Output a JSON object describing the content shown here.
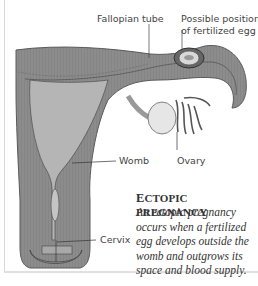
{
  "labels": {
    "fallopian_tube": "Fallopian tube",
    "possible_position_line1": "Possible position",
    "possible_position_line2": "of fertilized egg",
    "womb": "Womb",
    "ovary": "Ovary",
    "cervix": "Cervix"
  },
  "caption": {
    "title_first": "E",
    "title_rest": "CTOPIC PREGNANCY",
    "body": "An ectopic pregnancy occurs when a fertilized egg develops outside the womb and outgrows its space and blood supply."
  },
  "colors": {
    "tissue": "#8f8f8f",
    "tissue_dark": "#6e6e6e",
    "inner": "#b8b8b8",
    "ovary": "#e4e4e4",
    "text": "#444444"
  }
}
